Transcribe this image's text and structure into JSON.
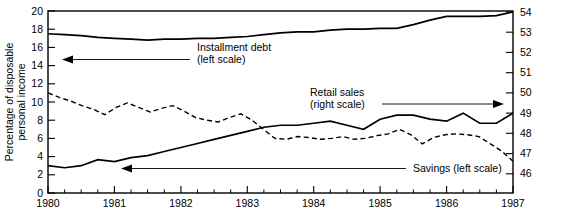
{
  "chart_data": {
    "type": "line",
    "title": "",
    "xlabel": "",
    "ylabel": "Percentage of disposable personal income",
    "ylabel_line1": "Percentage of disposable",
    "ylabel_line2": "personal income",
    "grid": false,
    "legend_position": "inline-annotations",
    "x": [
      1980.0,
      1980.25,
      1980.5,
      1980.75,
      1981.0,
      1981.25,
      1981.5,
      1981.75,
      1982.0,
      1982.25,
      1982.5,
      1982.75,
      1983.0,
      1983.25,
      1983.5,
      1983.75,
      1984.0,
      1984.25,
      1984.5,
      1984.75,
      1985.0,
      1985.25,
      1985.5,
      1985.75,
      1986.0,
      1986.25,
      1986.5,
      1986.75,
      1987.0
    ],
    "xlim": [
      1980,
      1987
    ],
    "xticks": [
      1980,
      1981,
      1982,
      1983,
      1984,
      1985,
      1986,
      1987
    ],
    "xtick_labels": [
      "1980",
      "1981",
      "1982",
      "1983",
      "1984",
      "1985",
      "1986",
      "1987"
    ],
    "x_minor_ticks_per_interval": 4,
    "left_axis": {
      "label": "Percentage of disposable personal income",
      "ylim": [
        0,
        20
      ],
      "ticks": [
        0,
        2,
        4,
        6,
        8,
        10,
        12,
        14,
        16,
        18,
        20
      ],
      "tick_labels": [
        "0",
        "2",
        "4",
        "6",
        "8",
        "10",
        "12",
        "14",
        "16",
        "18",
        "20"
      ]
    },
    "right_axis": {
      "label": "",
      "ylim": [
        45.45,
        54.45
      ],
      "ticks": [
        46,
        47,
        48,
        49,
        50,
        51,
        52,
        53,
        54
      ],
      "tick_labels": [
        "46",
        "47",
        "48",
        "49",
        "50",
        "51",
        "52",
        "53",
        "54"
      ]
    },
    "series": [
      {
        "name": "Installment debt",
        "scale": "left",
        "style": "solid",
        "annotation": "Installment debt (left scale)",
        "values": [
          17.5,
          17.4,
          17.3,
          17.1,
          17.0,
          16.9,
          16.8,
          16.9,
          16.9,
          17.0,
          17.0,
          17.1,
          17.2,
          17.4,
          17.6,
          17.7,
          17.7,
          17.9,
          18.0,
          18.0,
          18.1,
          18.1,
          18.5,
          19.0,
          19.4,
          19.4,
          19.4,
          19.5,
          19.9
        ]
      },
      {
        "name": "Retail sales",
        "scale": "right",
        "style": "solid",
        "annotation": "Retail sales (right scale)",
        "values": [
          46.8,
          46.7,
          46.8,
          47.1,
          47.0,
          47.2,
          47.3,
          47.5,
          47.7,
          47.9,
          48.1,
          48.3,
          48.5,
          48.7,
          48.8,
          48.8,
          48.9,
          49.0,
          48.8,
          48.6,
          49.1,
          49.3,
          49.3,
          49.1,
          49.0,
          49.4,
          48.9,
          48.9,
          49.4
        ]
      },
      {
        "name": "Savings",
        "scale": "left",
        "style": "dashed",
        "annotation": "Savings (left scale)",
        "values": [
          11.0,
          10.5,
          10.1,
          9.6,
          9.2,
          8.6,
          9.4,
          9.9,
          9.4,
          8.9,
          9.3,
          9.6,
          9.0,
          8.3,
          8.0,
          7.8,
          8.3,
          8.7,
          8.0,
          7.0,
          6.0,
          5.9,
          6.2,
          6.1,
          5.9,
          6.0,
          6.2,
          5.9,
          6.0
        ]
      }
    ],
    "savings_tail": {
      "note": "Savings series continues into the 1986-1987 region with a sharp decline at the end",
      "values": [
        6.3,
        6.5,
        7.0,
        6.4,
        5.4,
        6.1,
        6.4,
        6.5,
        6.4,
        6.2,
        5.4,
        4.6,
        3.5
      ]
    },
    "annotations": [
      {
        "id": "installment-debt",
        "line1": "Installment debt",
        "line2": "(left scale)",
        "arrow_direction": "left"
      },
      {
        "id": "retail-sales",
        "line1": "Retail sales",
        "line2": "(right scale)",
        "arrow_direction": "right"
      },
      {
        "id": "savings",
        "line1": "Savings (left scale)",
        "line2": "",
        "arrow_direction": "left"
      }
    ],
    "colors": {
      "line": "#000000",
      "background": "#ffffff",
      "axis": "#000000"
    }
  }
}
